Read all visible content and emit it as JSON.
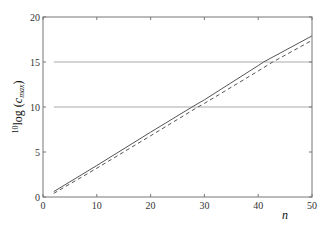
{
  "chart_data": {
    "type": "line",
    "title": "",
    "xlabel": "n",
    "ylabel": "10log (c_max)",
    "ylabel_parts": {
      "sup": "10",
      "main": "log (",
      "var": "c",
      "sub": "max",
      "close": ")"
    },
    "xlim": [
      0,
      50
    ],
    "ylim": [
      0,
      20
    ],
    "xticks": [
      0,
      10,
      20,
      30,
      40,
      50
    ],
    "yticks": [
      0,
      5,
      10,
      15,
      20
    ],
    "grid": false,
    "legend": null,
    "reference_lines": [
      {
        "y": 10,
        "x_from": 2,
        "x_to": 50,
        "color": "#aaaaaa",
        "style": "solid"
      },
      {
        "y": 15,
        "x_from": 2,
        "x_to": 50,
        "color": "#aaaaaa",
        "style": "solid"
      }
    ],
    "series": [
      {
        "name": "solid",
        "style": "solid",
        "color": "#555555",
        "x": [
          2,
          10,
          20,
          27.7,
          30,
          40,
          41,
          50
        ],
        "y": [
          0.6,
          3.5,
          7.2,
          10.0,
          10.8,
          14.6,
          15.0,
          17.9
        ]
      },
      {
        "name": "dashed",
        "style": "dashed",
        "color": "#555555",
        "x": [
          2,
          10,
          20,
          28.8,
          30,
          40,
          42.7,
          50
        ],
        "y": [
          0.4,
          3.2,
          6.8,
          10.0,
          10.4,
          14.0,
          15.0,
          17.4
        ]
      }
    ]
  }
}
